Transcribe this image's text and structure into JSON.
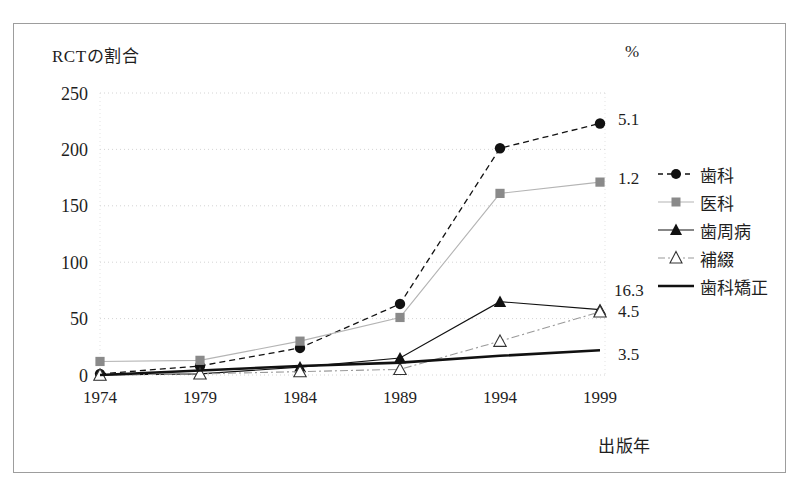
{
  "chart_data": {
    "type": "line",
    "title": "RCTの割合",
    "unit": "%",
    "xlabel": "出版年",
    "ylabel": "",
    "categories": [
      "1974",
      "1979",
      "1984",
      "1989",
      "1994",
      "1999"
    ],
    "yticks": [
      "0",
      "50",
      "100",
      "150",
      "200",
      "250"
    ],
    "ylim": [
      0,
      250
    ],
    "grid": true,
    "legend_position": "right",
    "series": [
      {
        "name": "歯科",
        "values": [
          1,
          8,
          24,
          63,
          201,
          223
        ],
        "end_label": "5.1",
        "marker": "filled-circle",
        "line_style": "dashed",
        "color": "#111111"
      },
      {
        "name": "医科",
        "values": [
          12,
          13,
          30,
          51,
          161,
          171
        ],
        "end_label": "1.2",
        "marker": "gray-square",
        "line_style": "solid",
        "color": "#8a8a8a"
      },
      {
        "name": "歯周病",
        "values": [
          0,
          1,
          7,
          15,
          65,
          58
        ],
        "end_label": "4.5",
        "marker": "filled-triangle",
        "line_style": "solid",
        "color": "#111111"
      },
      {
        "name": "補綴",
        "values": [
          0,
          1,
          3,
          5,
          30,
          56
        ],
        "end_label": "16.3",
        "marker": "open-triangle",
        "line_style": "dash-dot",
        "color": "#555555"
      },
      {
        "name": "歯科矯正",
        "values": [
          0,
          4,
          8,
          11,
          17,
          22
        ],
        "end_label": "3.5",
        "marker": "none",
        "line_style": "solid-thick",
        "color": "#111111"
      }
    ]
  },
  "legend": {
    "items": [
      {
        "label": "歯科"
      },
      {
        "label": "医科"
      },
      {
        "label": "歯周病"
      },
      {
        "label": "補綴"
      },
      {
        "label": "歯科矯正"
      }
    ]
  }
}
